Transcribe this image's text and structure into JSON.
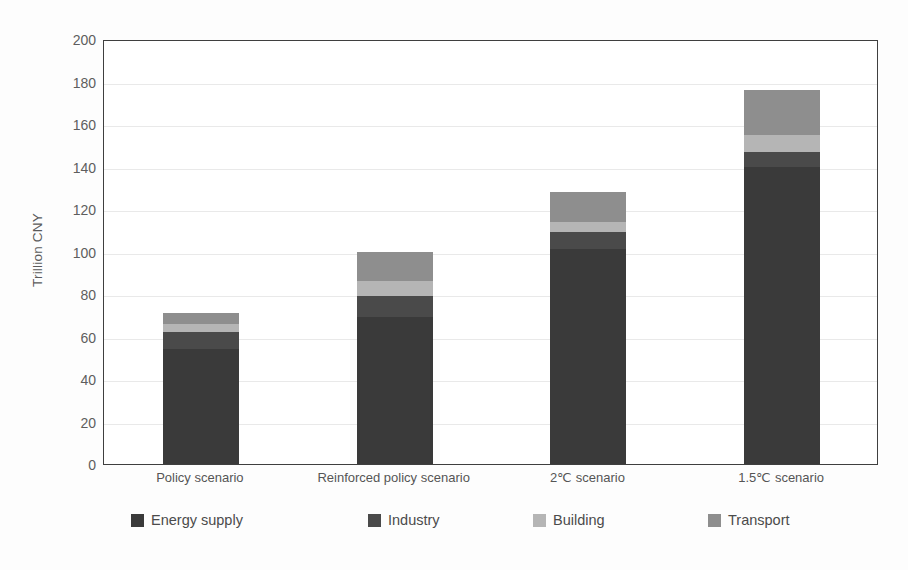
{
  "chart_data": {
    "type": "bar",
    "stacked": true,
    "title": "",
    "xlabel": "",
    "ylabel": "Trillion CNY",
    "ylim": [
      0,
      200
    ],
    "ytick_step": 20,
    "yticks": [
      0,
      20,
      40,
      60,
      80,
      100,
      120,
      140,
      160,
      180,
      200
    ],
    "ytick_labels": [
      "0",
      "20",
      "40",
      "60",
      "80",
      "100",
      "120",
      "140",
      "160",
      "180",
      "200"
    ],
    "grid": "horizontal",
    "legend_position": "bottom",
    "categories": [
      "Policy scenario",
      "Reinforced policy scenario",
      "2℃ scenario",
      "1.5℃ scenario"
    ],
    "series": [
      {
        "name": "Energy supply",
        "color": "#3a3a3a",
        "values": [
          54,
          69,
          101,
          140
        ]
      },
      {
        "name": "Industry",
        "color": "#4a4a4a",
        "values": [
          8,
          10,
          8,
          7
        ]
      },
      {
        "name": "Building",
        "color": "#b5b5b5",
        "values": [
          4,
          7,
          5,
          8
        ]
      },
      {
        "name": "Transport",
        "color": "#8e8e8e",
        "values": [
          5,
          14,
          14,
          21
        ]
      }
    ],
    "totals": [
      71,
      100,
      128,
      176
    ]
  },
  "legend": {
    "items": [
      {
        "label": "Energy supply",
        "color": "#3a3a3a"
      },
      {
        "label": "Industry",
        "color": "#4a4a4a"
      },
      {
        "label": "Building",
        "color": "#b5b5b5"
      },
      {
        "label": "Transport",
        "color": "#8e8e8e"
      }
    ]
  },
  "axes": {
    "y_title": "Trillion CNY"
  }
}
